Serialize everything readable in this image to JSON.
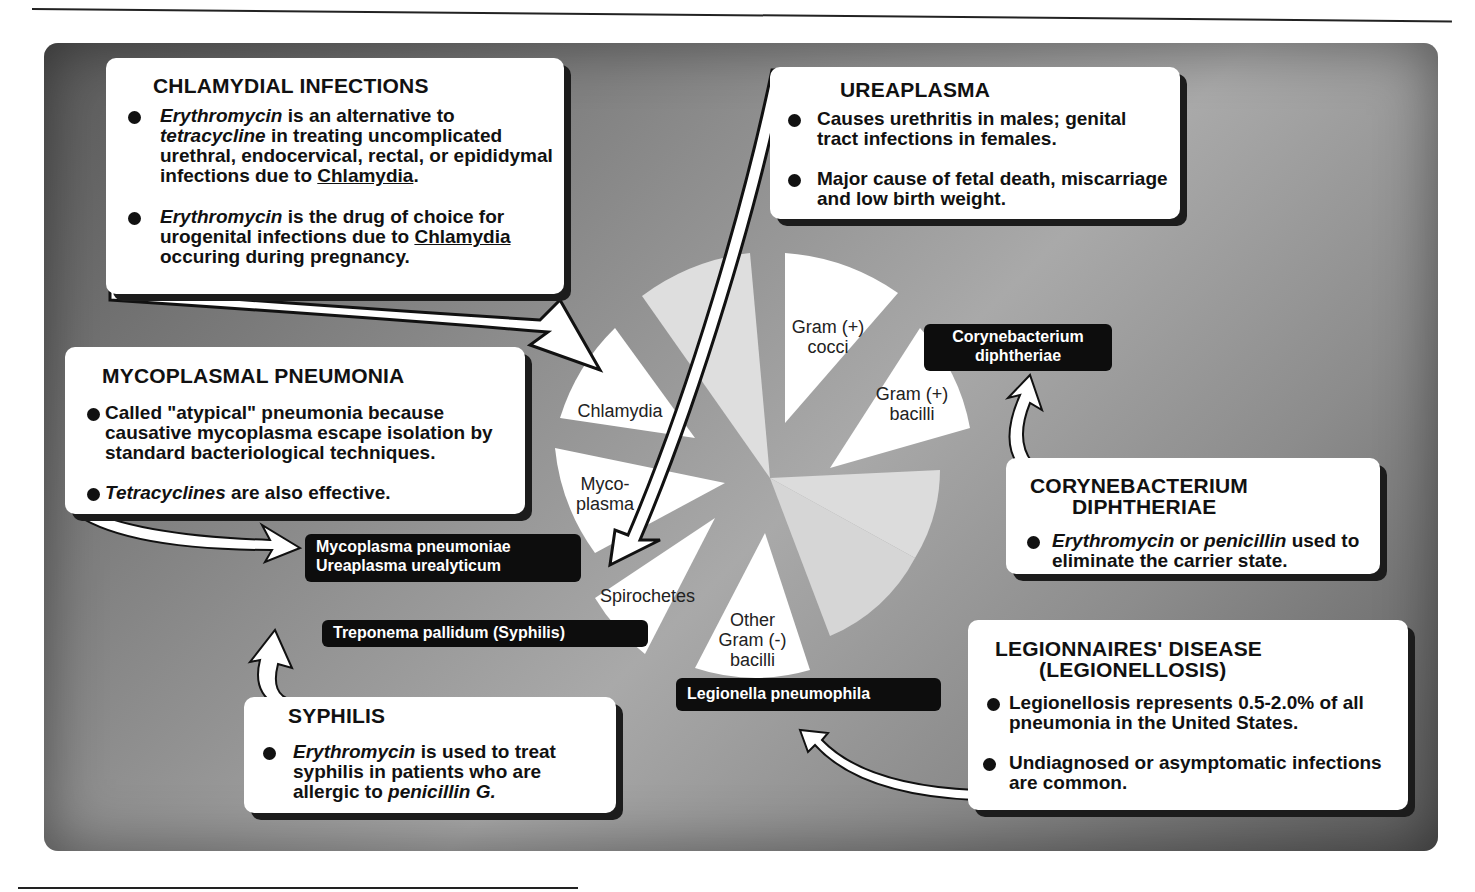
{
  "pie": {
    "slices": [
      {
        "label": "Gram (+) cocci",
        "lines": [
          "Gram (+)",
          "cocci"
        ],
        "highlighted": true
      },
      {
        "label": "Gram (+) bacilli",
        "lines": [
          "Gram (+)",
          "bacilli"
        ],
        "highlighted": true
      },
      {
        "label": "Other Gram (-) bacilli",
        "lines": [
          "Other",
          "Gram (-)",
          "bacilli"
        ],
        "highlighted": true
      },
      {
        "label": "Spirochetes",
        "lines": [
          "Spirochetes"
        ],
        "highlighted": true
      },
      {
        "label": "Mycoplasma",
        "lines": [
          "Myco-",
          "plasma"
        ],
        "highlighted": true
      },
      {
        "label": "Chlamydia",
        "lines": [
          "Chlamydia"
        ],
        "highlighted": true
      }
    ]
  },
  "tags": {
    "coryne": [
      "Corynebacterium",
      "diphtheriae"
    ],
    "myco": [
      "Mycoplasma pneumoniae",
      "Ureaplasma urealyticum"
    ],
    "treponema": "Treponema pallidum (Syphilis)",
    "legionella": "Legionella pneumophila"
  },
  "boxes": {
    "chlamydial": {
      "title": "CHLAMYDIAL INFECTIONS",
      "b1": {
        "drug": "Erythromycin",
        "t1": " is an alternative to",
        "drug2": "tetracycline",
        "t2": " in treating uncomplicated urethral, endocervical, rectal, or epididymal infections due to ",
        "org": "Chlamydia",
        "t3": "."
      },
      "b2": {
        "drug": "Erythromycin",
        "t1": " is the drug of choice for urogenital infections due to ",
        "org": "Chlamydia",
        "t2": " occuring during pregnancy."
      }
    },
    "ureaplasma": {
      "title": "UREAPLASMA",
      "b1": "Causes urethritis in males; genital tract infections in females.",
      "b2": "Major cause of fetal death, miscarriage and low birth weight."
    },
    "mycoplasmal": {
      "title": "MYCOPLASMAL PNEUMONIA",
      "b1": "Called \"atypical\" pneumonia because causative mycoplasma escape isolation by standard  bacteriological techniques.",
      "b2": {
        "drug": "Tetracyclines",
        "t1": " are also effective."
      }
    },
    "coryne": {
      "title1": "CORYNEBACTERIUM",
      "title2": "DIPHTHERIAE",
      "b1": {
        "drug": "Erythromycin",
        "t1": " or ",
        "drug2": "penicillin",
        "t2": " used to eliminate the carrier state."
      }
    },
    "legion": {
      "title1": "LEGIONNAIRES' DISEASE",
      "title2": "(LEGIONELLOSIS)",
      "b1": "Legionellosis represents 0.5-2.0% of all pneumonia in the United States.",
      "b2": "Undiagnosed or asymptomatic infections are common."
    },
    "syphilis": {
      "title": "SYPHILIS",
      "b1": {
        "drug": "Erythromycin",
        "t1": " is used to treat syphilis in patients who are allergic to ",
        "drug2": "penicillin G."
      }
    }
  },
  "colors": {
    "panel_dark": "#5a5a5a",
    "panel_light": "#a9a9a9",
    "slice_white": "#ffffff",
    "slice_faded": "#dcdcdc",
    "tag_bg": "#0d0d0d"
  }
}
